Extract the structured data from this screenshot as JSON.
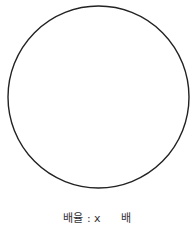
{
  "canvas": {
    "shape": "circle",
    "stroke_color": "#222222",
    "fill_color": "#ffffff"
  },
  "zoom_control": {
    "label": "배율 : x",
    "value": "",
    "placeholder": "",
    "unit": "배"
  }
}
